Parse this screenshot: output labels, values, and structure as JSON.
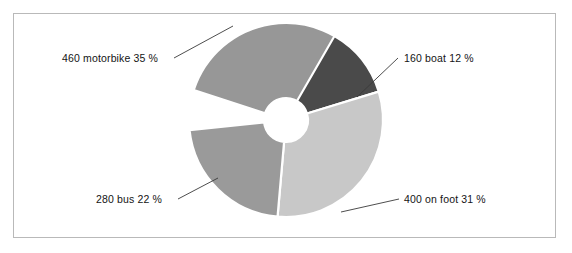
{
  "frame": {
    "border_color": "#b9b9b9",
    "background": "#ffffff"
  },
  "chart_data": {
    "type": "pie",
    "title": "",
    "subtitle": "",
    "xlabel": "",
    "ylabel": "",
    "legend_position": "none",
    "donut": true,
    "inner_radius_ratio": 0.23,
    "center": {
      "x": 286,
      "y": 120
    },
    "outer_radius": 97,
    "inner_radius": 22,
    "total": 1300,
    "categories": [
      "motorbike",
      "boat",
      "on foot",
      "bus"
    ],
    "values": [
      460,
      160,
      400,
      280
    ],
    "percentages": [
      35,
      12,
      31,
      22
    ],
    "colors": [
      "#979797",
      "#4a4a4a",
      "#c8c8c8",
      "#9a9a9a"
    ],
    "slice_separator_color": "#ffffff",
    "slices": [
      {
        "name": "motorbike",
        "label": "460 motorbike 35 %",
        "value": 460,
        "percent": 35,
        "color": "#979797",
        "start_angle": 288,
        "end_angle": 414,
        "label_x": 62,
        "label_y": 62,
        "leader": {
          "x1": 174,
          "y1": 58,
          "x2": 233,
          "y2": 26
        }
      },
      {
        "name": "boat",
        "label": "160 boat 12 %",
        "value": 160,
        "percent": 12,
        "color": "#4a4a4a",
        "start_angle": 30,
        "end_angle": 73,
        "label_x": 404,
        "label_y": 62,
        "leader": {
          "x1": 398,
          "y1": 58,
          "x2": 357,
          "y2": 97
        }
      },
      {
        "name": "on foot",
        "label": "400 on foot 31 %",
        "value": 400,
        "percent": 31,
        "color": "#c8c8c8",
        "start_angle": 73,
        "end_angle": 185,
        "label_x": 404,
        "label_y": 203,
        "leader": {
          "x1": 399,
          "y1": 199,
          "x2": 341,
          "y2": 212
        }
      },
      {
        "name": "bus",
        "label": "280 bus 22 %",
        "value": 280,
        "percent": 22,
        "color": "#9a9a9a",
        "start_angle": 185,
        "end_angle": 264,
        "label_x": 96,
        "label_y": 203,
        "leader": {
          "x1": 178,
          "y1": 199,
          "x2": 218,
          "y2": 178
        }
      }
    ]
  }
}
